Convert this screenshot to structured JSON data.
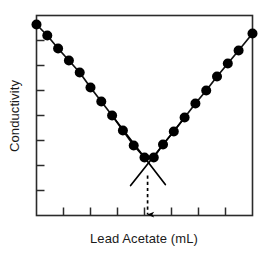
{
  "chart_data": {
    "type": "line",
    "title": "",
    "subtitle": "",
    "xlabel": "Lead Acetate (mL)",
    "ylabel": "Conductivity",
    "grid": false,
    "legend": "none",
    "axis_tick_labels_shown": false,
    "xlim": [
      0,
      14
    ],
    "ylim": [
      0,
      10
    ],
    "x_ticks": [
      1.75,
      3.5,
      5.25,
      7.0,
      8.75,
      10.5,
      12.25
    ],
    "y_ticks": [
      1.25,
      2.5,
      3.75,
      5.0,
      6.25,
      7.5,
      8.75
    ],
    "series": [
      {
        "name": "Titration curve",
        "marker": "filled-circle",
        "x": [
          0.0,
          0.7,
          1.4,
          2.1,
          2.8,
          3.5,
          4.2,
          4.9,
          5.6,
          6.3,
          7.0,
          7.6,
          8.2,
          8.9,
          9.6,
          10.3,
          11.0,
          11.7,
          12.4,
          13.1,
          14.0
        ],
        "y": [
          9.55,
          9.0,
          8.35,
          7.75,
          7.15,
          6.4,
          5.7,
          5.0,
          4.25,
          3.5,
          2.9,
          2.9,
          3.55,
          4.2,
          4.9,
          5.6,
          6.25,
          6.95,
          7.6,
          8.25,
          9.1
        ]
      }
    ],
    "annotations": [
      {
        "type": "extrapolation-line",
        "name": "left-branch-extrapolation",
        "from": [
          4.9,
          5.0
        ],
        "to": [
          8.35,
          1.55
        ]
      },
      {
        "type": "extrapolation-line",
        "name": "right-branch-extrapolation",
        "from": [
          9.6,
          4.9
        ],
        "to": [
          6.1,
          1.5
        ]
      },
      {
        "type": "dashed-arrow",
        "name": "equivalence-point-arrow",
        "from": [
          7.2,
          2.0
        ],
        "to": [
          7.2,
          0.0
        ],
        "direction": "down",
        "meaning": "equivalence point"
      }
    ],
    "colors": {
      "line": "#111111",
      "marker": "#000000",
      "axis": "#2b2b2b",
      "annotation": "#000000",
      "background": "#ffffff"
    }
  },
  "labels": {
    "y_axis": "Conductivity",
    "x_axis": "Lead Acetate (mL)"
  },
  "icons": {
    "arrow_down": "equivalence-point-arrow-icon"
  }
}
